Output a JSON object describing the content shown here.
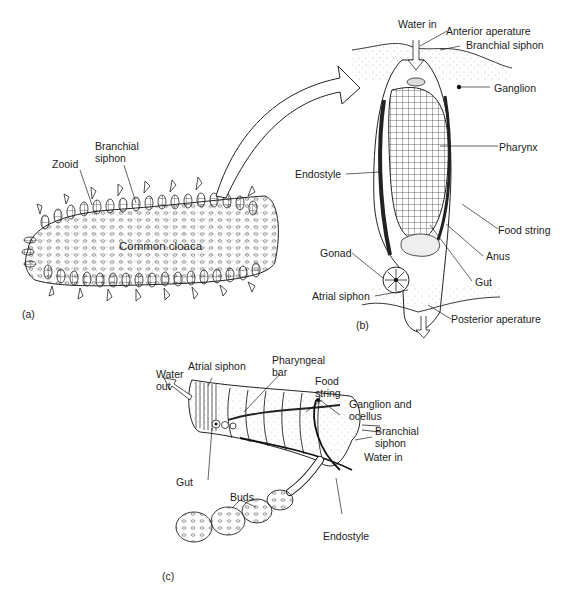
{
  "figure": {
    "panels": [
      {
        "id": "a",
        "tag": "(a)",
        "labels": {
          "branchial_siphon": "Branchial siphon",
          "zooid": "Zooid",
          "common_cloaca": "Common cloaca"
        }
      },
      {
        "id": "b",
        "tag": "(b)",
        "labels": {
          "water_in": "Water in",
          "anterior_aperature": "Anterior aperature",
          "branchial_siphon": "Branchial siphon",
          "ganglion": "Ganglion",
          "pharynx": "Pharynx",
          "endostyle": "Endostyle",
          "food_string": "Food string",
          "gonad": "Gonad",
          "anus": "Anus",
          "gut": "Gut",
          "atrial_siphon": "Atrial siphon",
          "posterior_aperature": "Posterior aperature"
        }
      },
      {
        "id": "c",
        "tag": "(c)",
        "labels": {
          "water_out": "Water out",
          "atrial_siphon": "Atrial siphon",
          "pharyngeal_bar": "Pharyngeal bar",
          "food_string": "Food string",
          "ganglion_and_ocellus": "Ganglion and ocellus",
          "branchial_siphon": "Branchial siphon",
          "water_in": "Water in",
          "gut": "Gut",
          "buds": "Buds",
          "endostyle": "Endostyle"
        }
      }
    ],
    "colors": {
      "ink": "#1c1c1c",
      "stipple": "#9a9a9a",
      "background": "#ffffff"
    }
  }
}
